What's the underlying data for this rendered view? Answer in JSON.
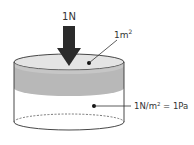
{
  "diagram": {
    "force_label": "1N",
    "area_label_base": "1m",
    "area_label_sup": "2",
    "pressure_label_pre": "1N/m",
    "pressure_label_sup": "2",
    "pressure_label_post": " = 1Pa"
  },
  "colors": {
    "arrow": "#2b2b2b",
    "plate_top": "#e6e6e6",
    "band": "#b5b5b5",
    "outline": "#333333",
    "text": "#333333"
  }
}
